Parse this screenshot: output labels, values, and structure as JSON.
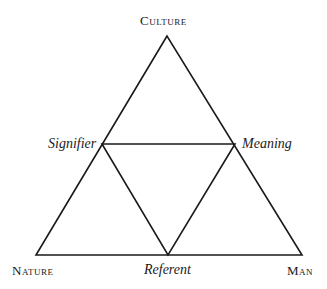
{
  "diagram": {
    "type": "triangle-subdivided",
    "stroke_color": "#1a1a1a",
    "vertices": {
      "top": {
        "label": "Culture",
        "x": 167,
        "y": 36
      },
      "bottom_left": {
        "label": "Nature",
        "x": 36,
        "y": 255
      },
      "bottom_right": {
        "label": "Man",
        "x": 302,
        "y": 255
      }
    },
    "midpoints": {
      "left": {
        "label": "Signifier",
        "x": 102,
        "y": 144
      },
      "right": {
        "label": "Meaning",
        "x": 235,
        "y": 144
      },
      "bottom": {
        "label": "Referent",
        "x": 168,
        "y": 255
      }
    }
  },
  "labels": {
    "culture": "Culture",
    "nature": "Nature",
    "man": "Man",
    "signifier": "Signifier",
    "meaning": "Meaning",
    "referent": "Referent"
  }
}
